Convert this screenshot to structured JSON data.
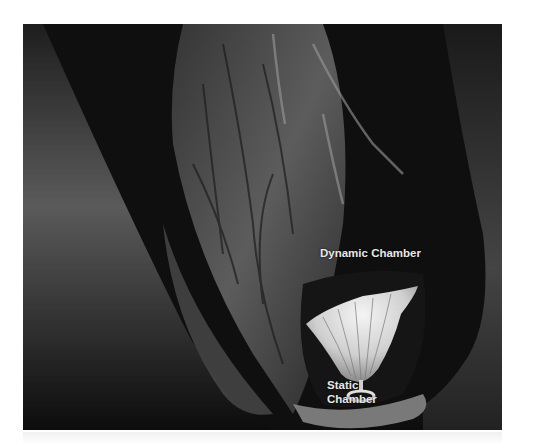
{
  "figure": {
    "labels": {
      "dynamic_chamber": "Dynamic Chamber",
      "static_chamber_line1": "Static",
      "static_chamber_line2": "Chamber"
    },
    "colors": {
      "background": "#ffffff",
      "image_dark": "#111111",
      "label_text": "#e8e8e8",
      "implant": "#d8d8d8"
    }
  }
}
